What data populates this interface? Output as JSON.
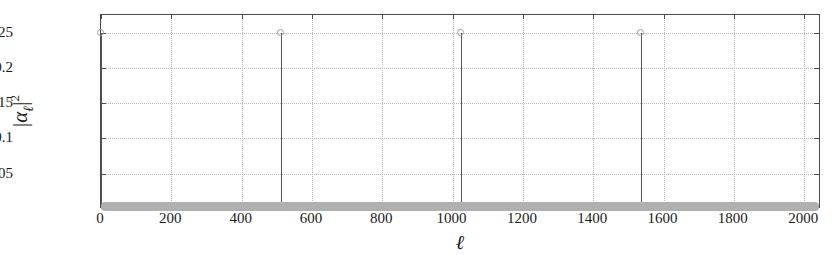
{
  "chart_data": {
    "type": "scatter",
    "plot_style": "stem",
    "title": "",
    "subtitle": "",
    "xlabel": "ℓ",
    "ylabel": "|αℓ|²",
    "xlim": [
      0,
      2048
    ],
    "ylim": [
      0,
      0.275
    ],
    "grid": true,
    "legend": null,
    "xticks": [
      0,
      200,
      400,
      600,
      800,
      1000,
      1200,
      1400,
      1600,
      1800,
      2000
    ],
    "xticklabels": [
      "0",
      "200",
      "400",
      "600",
      "800",
      "1000",
      "1200",
      "1400",
      "1600",
      "1800",
      "2000"
    ],
    "yticks": [
      0.05,
      0.1,
      0.15,
      0.2,
      0.25
    ],
    "yticklabels": [
      "0.05",
      "0.1",
      "0.15",
      "0.2",
      "0.25"
    ],
    "baseline_value": 0,
    "marker": "open-circle",
    "x": [
      0,
      512,
      1024,
      1536
    ],
    "values": [
      0.25,
      0.25,
      0.25,
      0.25
    ],
    "points": [
      {
        "x": 0,
        "y": 0.25
      },
      {
        "x": 512,
        "y": 0.25
      },
      {
        "x": 1024,
        "y": 0.25
      },
      {
        "x": 1536,
        "y": 0.25
      }
    ],
    "colors": {
      "axis": "#4a4a4a",
      "grid": "#b9b9b9",
      "stem_line": "#555555",
      "marker_edge": "#9a9a9a",
      "baseline": "#b0b0b0",
      "background": "#ffffff",
      "text": "#1a1a1a"
    }
  }
}
